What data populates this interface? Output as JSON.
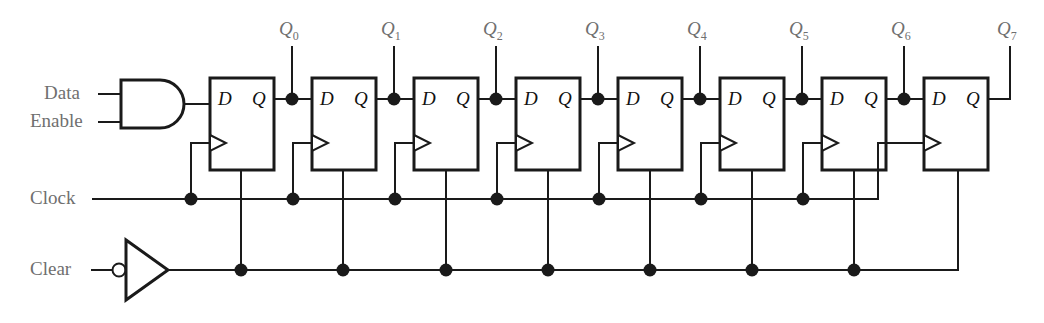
{
  "figure": {
    "type": "logic-circuit-schematic",
    "wire_color": "#1a1a1a",
    "label_color": "#6f6f6f",
    "port_color": "#111111"
  },
  "inputs": [
    {
      "name": "data-input",
      "label": "Data"
    },
    {
      "name": "enable-input",
      "label": "Enable"
    },
    {
      "name": "clock-input",
      "label": "Clock"
    },
    {
      "name": "clear-input",
      "label": "Clear"
    }
  ],
  "gates": [
    {
      "name": "and-gate",
      "type": "AND",
      "inputs": [
        "Data",
        "Enable"
      ]
    },
    {
      "name": "clear-inverter",
      "type": "NOT",
      "bubble": "input"
    }
  ],
  "flipflops": [
    {
      "index": 0,
      "d": "D",
      "q": "Q",
      "clock_symbol": "edge-triangle"
    },
    {
      "index": 1,
      "d": "D",
      "q": "Q",
      "clock_symbol": "edge-triangle"
    },
    {
      "index": 2,
      "d": "D",
      "q": "Q",
      "clock_symbol": "edge-triangle"
    },
    {
      "index": 3,
      "d": "D",
      "q": "Q",
      "clock_symbol": "edge-triangle"
    },
    {
      "index": 4,
      "d": "D",
      "q": "Q",
      "clock_symbol": "edge-triangle"
    },
    {
      "index": 5,
      "d": "D",
      "q": "Q",
      "clock_symbol": "edge-triangle"
    },
    {
      "index": 6,
      "d": "D",
      "q": "Q",
      "clock_symbol": "edge-triangle"
    },
    {
      "index": 7,
      "d": "D",
      "q": "Q",
      "clock_symbol": "edge-triangle"
    }
  ],
  "outputs": [
    {
      "name": "q0-output",
      "base": "Q",
      "sub": "0"
    },
    {
      "name": "q1-output",
      "base": "Q",
      "sub": "1"
    },
    {
      "name": "q2-output",
      "base": "Q",
      "sub": "2"
    },
    {
      "name": "q3-output",
      "base": "Q",
      "sub": "3"
    },
    {
      "name": "q4-output",
      "base": "Q",
      "sub": "4"
    },
    {
      "name": "q5-output",
      "base": "Q",
      "sub": "5"
    },
    {
      "name": "q6-output",
      "base": "Q",
      "sub": "6"
    },
    {
      "name": "q7-output",
      "base": "Q",
      "sub": "7"
    }
  ]
}
